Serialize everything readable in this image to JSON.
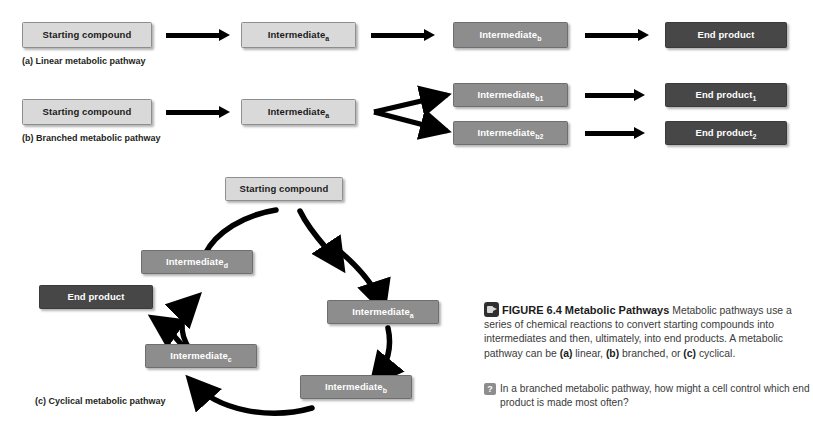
{
  "figure": {
    "number": "FIGURE 6.4",
    "title": "Metabolic Pathways",
    "body_1": " Metabolic pathways use a series of chemical reactions to convert starting compounds into intermediates and then, ultimately, into end products. A metabolic pathway can be ",
    "tag_a": "(a)",
    "body_2": " linear, ",
    "tag_b": "(b)",
    "body_3": " branched, or ",
    "tag_c": "(c)",
    "body_4": " cyclical.",
    "media_icon": "video-icon",
    "question_icon": "question-mark-icon",
    "question": "In a branched metabolic pathway, how might a cell control which end product is made most often?",
    "question_icon_glyph": "?"
  },
  "colors": {
    "light_box": "#d9d9d9",
    "light_border": "#8e8e8e",
    "mid_box": "#8d8d8d",
    "mid_border": "#6e6e6e",
    "dark_box": "#474747",
    "dark_border": "#3a3a3a",
    "arrow": "#000000",
    "text_dark": "#1b1b1b",
    "text_light": "#ffffff",
    "caption_text": "#3a3a3a"
  },
  "panel_a": {
    "label": "(a) Linear metabolic pathway",
    "nodes": [
      {
        "name": "Starting compound",
        "sub": "",
        "tone": "light"
      },
      {
        "name": "Intermediate",
        "sub": "a",
        "tone": "light"
      },
      {
        "name": "Intermediate",
        "sub": "b",
        "tone": "mid"
      },
      {
        "name": "End product",
        "sub": "",
        "tone": "dark"
      }
    ]
  },
  "panel_b": {
    "label": "(b) Branched metabolic pathway",
    "nodes": [
      {
        "name": "Starting compound",
        "sub": "",
        "tone": "light"
      },
      {
        "name": "Intermediate",
        "sub": "a",
        "tone": "light"
      },
      {
        "name": "Intermediate",
        "sub": "b1",
        "tone": "mid"
      },
      {
        "name": "Intermediate",
        "sub": "b2",
        "tone": "mid"
      },
      {
        "name": "End product",
        "sub": "1",
        "tone": "dark"
      },
      {
        "name": "End product",
        "sub": "2",
        "tone": "dark"
      }
    ]
  },
  "panel_c": {
    "label": "(c) Cyclical metabolic pathway",
    "nodes": [
      {
        "name": "Starting compound",
        "sub": "",
        "tone": "light"
      },
      {
        "name": "Intermediate",
        "sub": "a",
        "tone": "mid"
      },
      {
        "name": "Intermediate",
        "sub": "b",
        "tone": "mid"
      },
      {
        "name": "Intermediate",
        "sub": "c",
        "tone": "mid"
      },
      {
        "name": "Intermediate",
        "sub": "d",
        "tone": "mid"
      },
      {
        "name": "End product",
        "sub": "",
        "tone": "dark"
      }
    ]
  }
}
